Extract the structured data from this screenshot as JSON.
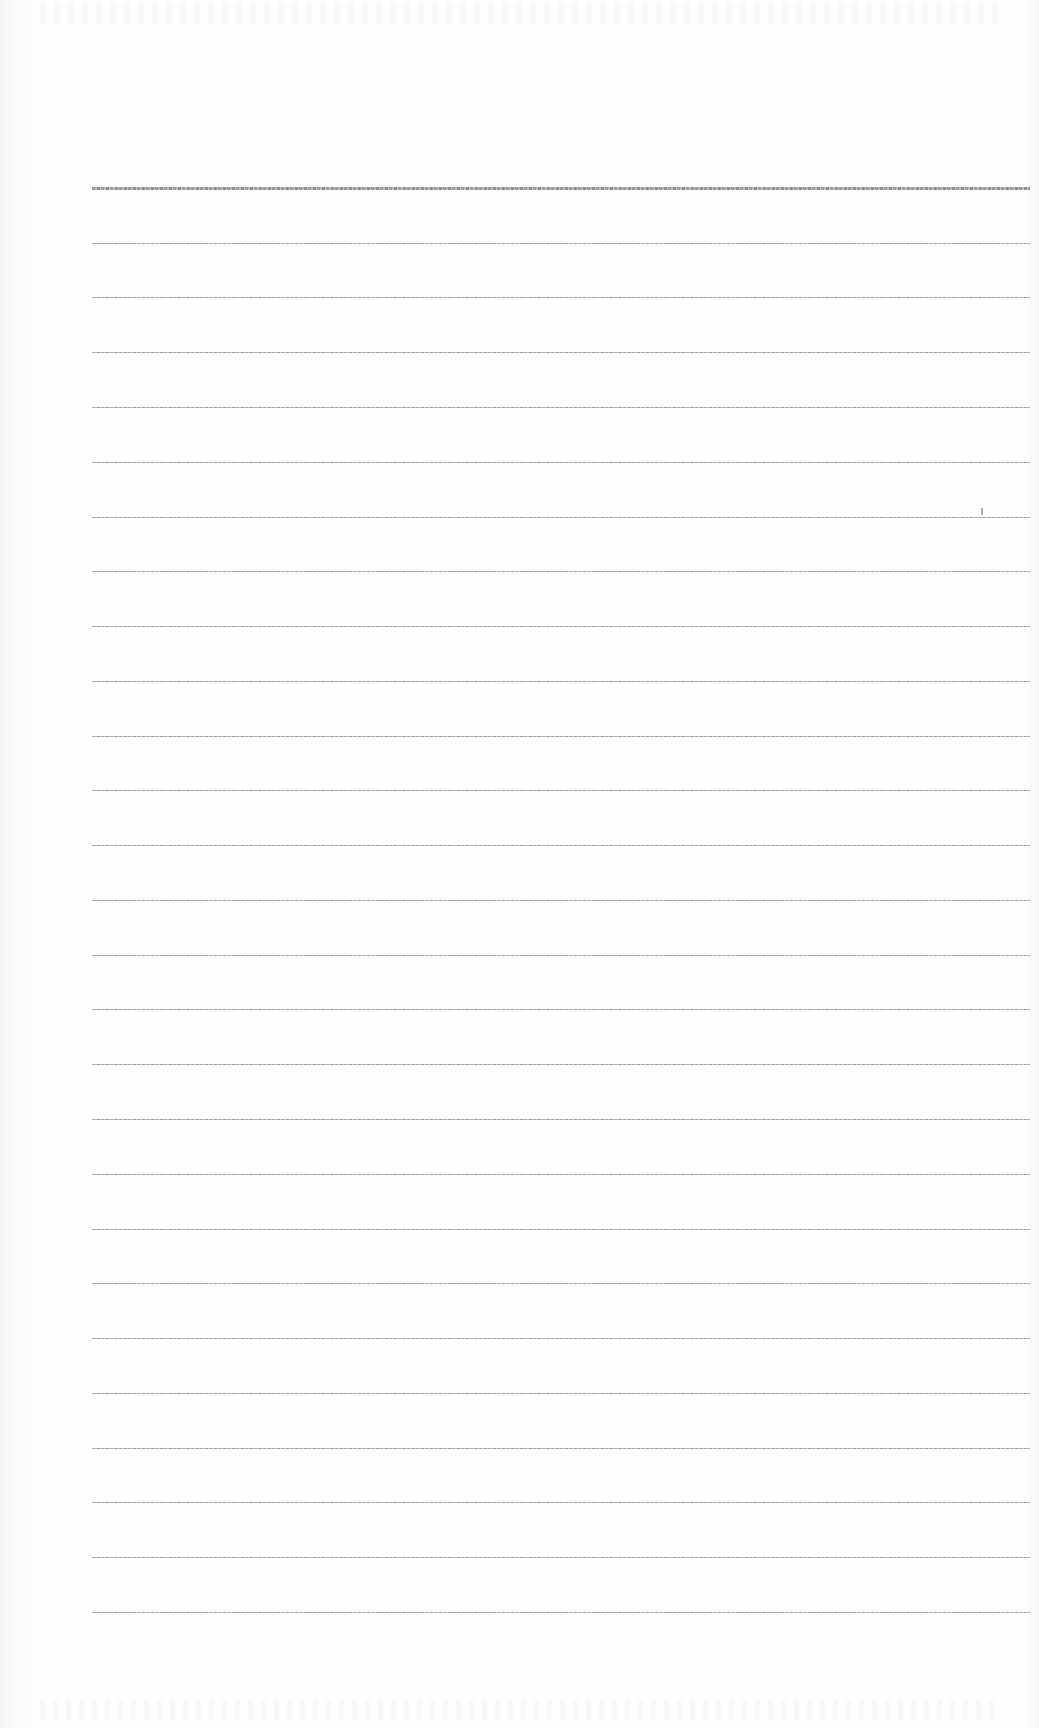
{
  "sheet": {
    "type": "blank lined paper",
    "background_color": "#fdfdfd",
    "line_color": "#a9a9a9",
    "line_start_x": 92,
    "line_end_x": 1030,
    "line_spacing_px": 54.8,
    "line_count": 27,
    "first_line_heavy": true,
    "lines_y": [
      188,
      243,
      297,
      352,
      407,
      462,
      517,
      571,
      626,
      681,
      736,
      790,
      845,
      900,
      955,
      1009,
      1064,
      1119,
      1174,
      1229,
      1283,
      1338,
      1393,
      1448,
      1502,
      1557,
      1612
    ],
    "text_content": "",
    "marks": [
      {
        "type": "speck",
        "x": 981,
        "y": 508
      }
    ]
  }
}
